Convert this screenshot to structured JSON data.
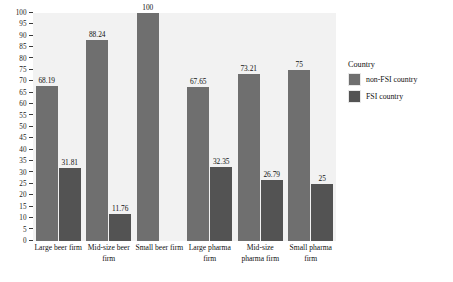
{
  "chart_data": {
    "type": "bar",
    "title": "",
    "xlabel": "",
    "ylabel": "",
    "ylim": [
      0,
      100
    ],
    "ytick_step": 5,
    "grid": false,
    "legend_position": "right",
    "legend_title": "Country",
    "categories": [
      "Large beer firm",
      "Mid-size beer firm",
      "Small beer firm",
      "Large pharma firm",
      "Mid-size pharma firm",
      "Small pharma firm"
    ],
    "yticks": [
      0,
      5,
      10,
      15,
      20,
      25,
      30,
      35,
      40,
      45,
      50,
      55,
      60,
      65,
      70,
      75,
      80,
      85,
      90,
      95,
      100
    ],
    "series": [
      {
        "name": "non-FSI country",
        "color": "#6f6f6f",
        "values": [
          68.19,
          88.24,
          100,
          67.65,
          73.21,
          75
        ],
        "labels": [
          "68.19",
          "88.24",
          "100",
          "67.65",
          "73.21",
          "75"
        ]
      },
      {
        "name": "FSI country",
        "color": "#535353",
        "values": [
          31.81,
          11.76,
          null,
          32.35,
          26.79,
          25
        ],
        "labels": [
          "31.81",
          "11.76",
          "",
          "32.35",
          "26.79",
          "25"
        ]
      }
    ]
  },
  "legend": {
    "title": "Country",
    "entries": [
      {
        "label": "non-FSI country",
        "color": "#6f6f6f"
      },
      {
        "label": "FSI country",
        "color": "#535353"
      }
    ]
  }
}
